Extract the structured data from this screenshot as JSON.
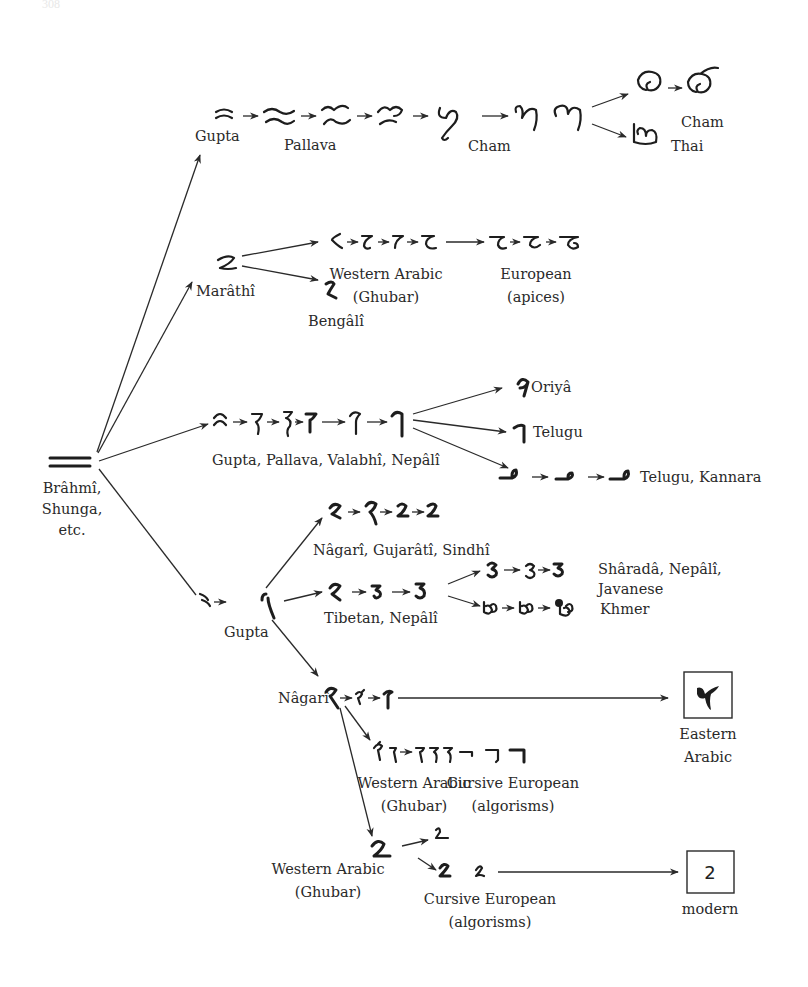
{
  "page": {
    "page_number": "308"
  },
  "diagram": {
    "root": {
      "label_lines": [
        "Brâhmî,",
        "Shunga,",
        "etc."
      ],
      "glyph": "two-horizontal-strokes"
    },
    "branches": [
      {
        "id": "gupta-cham-thai",
        "start_label": "Gupta",
        "stage_labels": [
          "Pallava",
          "Cham"
        ],
        "ends": [
          {
            "label": "Cham"
          },
          {
            "label": "Thai"
          }
        ]
      },
      {
        "id": "marathi",
        "start_label": "Marâthî",
        "sub": [
          {
            "label": "Bengâlî"
          },
          {
            "label_lines": [
              "Western Arabic",
              "(Ghubar)"
            ]
          },
          {
            "label_lines": [
              "European",
              "(apices)"
            ]
          }
        ]
      },
      {
        "id": "gupta-pallava",
        "start_label": "Gupta, Pallava, Valabhî, Nepâlî",
        "ends": [
          {
            "label": "Oriyâ"
          },
          {
            "label": "Telugu"
          },
          {
            "label": "Telugu, Kannara"
          }
        ]
      },
      {
        "id": "gupta-lower",
        "start_label": "Gupta",
        "sub": [
          {
            "label": "Nâgarî, Gujarâtî, Sindhî"
          },
          {
            "label": "Tibetan, Nepâlî",
            "ends": [
              {
                "label_lines": [
                  "Shâradâ, Nepâlî,",
                  "Javanese"
                ]
              },
              {
                "label": "Khmer"
              }
            ]
          },
          {
            "label": "Nâgarî",
            "ends": [
              {
                "label_lines": [
                  "Eastern",
                  "Arabic"
                ],
                "boxed_glyph": "٢"
              },
              {
                "label_lines": [
                  "Western Arabic",
                  "(Ghubar)"
                ]
              },
              {
                "label_lines": [
                  "Cursive European",
                  "(algorisms)"
                ]
              }
            ]
          },
          {
            "label_lines": [
              "Western Arabic",
              "(Ghubar)"
            ],
            "ends": [
              {
                "label_lines": [
                  "Cursive European",
                  "(algorisms)"
                ]
              },
              {
                "label": "modern",
                "boxed_glyph": "2"
              }
            ]
          }
        ]
      }
    ]
  },
  "labels": {
    "gupta_top": "Gupta",
    "pallava": "Pallava",
    "cham_mid": "Cham",
    "cham_end": "Cham",
    "thai": "Thai",
    "marathi": "Marâthî",
    "bengali": "Bengâlî",
    "western_arabic_1_a": "Western Arabic",
    "western_arabic_1_b": "(Ghubar)",
    "european_a": "European",
    "european_b": "(apices)",
    "oriya": "Oriyâ",
    "telugu": "Telugu",
    "telugu_kannara": "Telugu, Kannara",
    "gupta_pallava": "Gupta, Pallava, Valabhî, Nepâlî",
    "brahmi_1": "Brâhmî,",
    "brahmi_2": "Shunga,",
    "brahmi_3": "etc.",
    "nagari_gujarati": "Nâgarî, Gujarâtî, Sindhî",
    "sharada_a": "Shâradâ, Nepâlî,",
    "sharada_b": "Javanese",
    "tibetan": "Tibetan, Nepâlî",
    "khmer": "Khmer",
    "gupta_lower": "Gupta",
    "nagari": "Nâgarî",
    "eastern_a": "Eastern",
    "eastern_b": "Arabic",
    "eastern_glyph": "٢",
    "western_arabic_2_a": "Western Arabic",
    "western_arabic_2_b": "(Ghubar)",
    "cursive_1_a": "Cursive European",
    "cursive_1_b": "(algorisms)",
    "western_arabic_3_a": "Western Arabic",
    "western_arabic_3_b": "(Ghubar)",
    "cursive_2_a": "Cursive European",
    "cursive_2_b": "(algorisms)",
    "modern": "modern",
    "modern_glyph": "2"
  }
}
